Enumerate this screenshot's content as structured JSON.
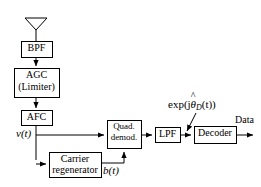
{
  "diagram": {
    "type": "signal-flow-block-diagram",
    "background_color": "#ffffff",
    "line_color": "#000000",
    "blocks": [
      {
        "id": "bpf",
        "label": "BPF",
        "x": 21,
        "y": 41,
        "w": 31,
        "h": 16
      },
      {
        "id": "agc",
        "label_line1": "AGC",
        "label_line2": "(Limiter)",
        "x": 14,
        "y": 68,
        "w": 45,
        "h": 29
      },
      {
        "id": "afc",
        "label": "AFC",
        "x": 21,
        "y": 110,
        "w": 31,
        "h": 15
      },
      {
        "id": "carrier",
        "label_line1": "Carrier",
        "label_line2": "regenerator",
        "x": 49,
        "y": 152,
        "w": 52,
        "h": 25
      },
      {
        "id": "quad",
        "label_line1": "Quad.",
        "label_line2": "demod.",
        "x": 107,
        "y": 120,
        "w": 34,
        "h": 28
      },
      {
        "id": "lpf",
        "label": "LPF",
        "x": 155,
        "y": 127,
        "w": 25,
        "h": 15
      },
      {
        "id": "decoder",
        "label": "Decoder",
        "x": 194,
        "y": 126,
        "w": 42,
        "h": 17
      }
    ],
    "signal_labels": [
      {
        "id": "v_of_t",
        "text": "v(t)",
        "x": 16,
        "y": 128
      },
      {
        "id": "b_of_t",
        "text": "b(t)",
        "x": 103,
        "y": 165
      },
      {
        "id": "data_out",
        "text": "Data",
        "x": 237,
        "y": 117
      }
    ],
    "expression_label": {
      "id": "exp-jtheta-d",
      "prefix": "exp(j",
      "hat_symbol": "^",
      "variable": "θ",
      "subscript": "D",
      "suffix": "(t))",
      "full_text": "exp(jθ̂_D(t))",
      "x": 170,
      "y": 99
    },
    "antenna": {
      "id": "antenna",
      "apex_x": 36,
      "top_y": 18,
      "bottom_y": 30,
      "half_width": 11
    }
  }
}
